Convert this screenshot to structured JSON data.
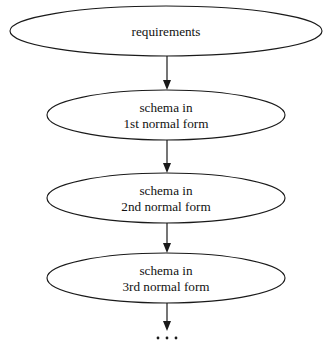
{
  "diagram": {
    "type": "flowchart",
    "orientation": "vertical-top-down",
    "colors": {
      "background": "#ffffff",
      "stroke": "#1a1a1a",
      "node_fill": "#ffffff",
      "text": "#111111"
    },
    "nodes": [
      {
        "id": "requirements",
        "shape": "ellipse",
        "lines": [
          "requirements"
        ],
        "cx": 166,
        "cy": 31,
        "rx": 156,
        "ry": 25
      },
      {
        "id": "first-normal-form",
        "shape": "ellipse",
        "lines": [
          "schema in",
          "1st normal form"
        ],
        "cx": 166,
        "cy": 115,
        "rx": 119,
        "ry": 25
      },
      {
        "id": "second-normal-form",
        "shape": "ellipse",
        "lines": [
          "schema in",
          "2nd normal form"
        ],
        "cx": 166,
        "cy": 198,
        "rx": 119,
        "ry": 25
      },
      {
        "id": "third-normal-form",
        "shape": "ellipse",
        "lines": [
          "schema in",
          "3rd normal form"
        ],
        "cx": 166,
        "cy": 278,
        "rx": 119,
        "ry": 25
      }
    ],
    "connectors": [
      {
        "id": "requirements-to-1nf",
        "from": "requirements",
        "to": "first-normal-form",
        "x": 167,
        "y1": 56,
        "y2": 90,
        "arrow": true
      },
      {
        "id": "1nf-to-2nf",
        "from": "first-normal-form",
        "to": "second-normal-form",
        "x": 167,
        "y1": 140,
        "y2": 173,
        "arrow": true
      },
      {
        "id": "2nf-to-3nf",
        "from": "second-normal-form",
        "to": "third-normal-form",
        "x": 167,
        "y1": 223,
        "y2": 253,
        "arrow": true
      },
      {
        "id": "3nf-to-continuation",
        "from": "third-normal-form",
        "to": "continuation",
        "x": 167,
        "y1": 303,
        "y2": 331,
        "arrow": true
      }
    ],
    "continuation": {
      "id": "continuation",
      "label": "...",
      "symbol": "ellipsis",
      "dot_count": 3,
      "cy": 338,
      "cx": 167,
      "spacing": 9,
      "radius": 1.4
    }
  }
}
